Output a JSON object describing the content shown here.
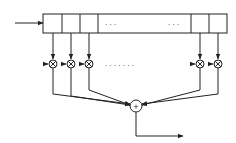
{
  "diagram": {
    "type": "FIR filter / tapped delay line",
    "register": {
      "cells_left": 3,
      "cells_right": 2,
      "ellipsis_top_left": ". . .",
      "ellipsis_top_right": ". . ."
    },
    "multiplier_symbol": "⊗",
    "multiplier_count_visible": 5,
    "ellipsis_middle": ". . . . . . .",
    "sum_symbol": "+",
    "colors": {
      "stroke": "#222222",
      "background": "#ffffff"
    }
  }
}
